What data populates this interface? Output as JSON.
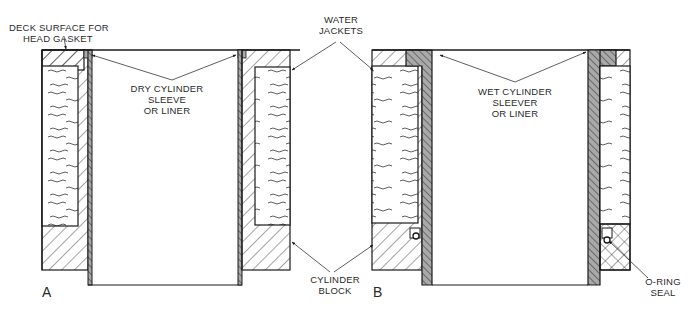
{
  "figure": {
    "panels": [
      {
        "id": "A",
        "letter": "A",
        "type": "dry-sleeve"
      },
      {
        "id": "B",
        "letter": "B",
        "type": "wet-sleeve"
      }
    ],
    "labels": {
      "deck_surface": [
        "DECK SURFACE FOR",
        "HEAD GASKET"
      ],
      "water_jackets": [
        "WATER",
        "JACKETS"
      ],
      "dry_sleeve": [
        "DRY CYLINDER",
        "SLEEVE",
        "OR LINER"
      ],
      "wet_sleeve": [
        "WET CYLINDER",
        "SLEEVER",
        "OR LINER"
      ],
      "cylinder_block": [
        "CYLINDER",
        "BLOCK"
      ],
      "o_ring": [
        "O-RING",
        "SEAL"
      ]
    },
    "colors": {
      "line": "#1a1a1a",
      "sleeve_fill": "#a9a9a9",
      "background": "#ffffff",
      "text": "#2a2a2a"
    }
  }
}
